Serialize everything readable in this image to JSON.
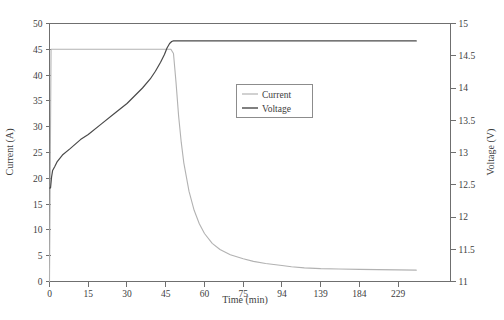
{
  "chart_data": {
    "type": "line",
    "title": "",
    "subtitle": "",
    "xlabel": "Time (min)",
    "ylabel": "Current (A)",
    "y2label": "Voltage (V)",
    "grid": false,
    "legend_position": "center-right",
    "x_axis": {
      "label": "Time (min)",
      "scale": "categorical-uneven",
      "tick_labels": [
        "0",
        "15",
        "30",
        "45",
        "60",
        "75",
        "94",
        "139",
        "184",
        "229"
      ],
      "tick_values": [
        0,
        15,
        30,
        45,
        60,
        75,
        94,
        139,
        184,
        229
      ]
    },
    "y_axis_left": {
      "label": "Current (A)",
      "ylim": [
        0,
        50
      ],
      "tick_step": 5,
      "tick_labels": [
        "0",
        "5",
        "10",
        "15",
        "20",
        "25",
        "30",
        "35",
        "40",
        "45",
        "50"
      ],
      "tick_values": [
        0,
        5,
        10,
        15,
        20,
        25,
        30,
        35,
        40,
        45,
        50
      ]
    },
    "y_axis_right": {
      "label": "Voltage (V)",
      "ylim": [
        11,
        15
      ],
      "tick_step": 0.5,
      "tick_labels": [
        "11",
        "11.5",
        "12",
        "12.5",
        "13",
        "13.5",
        "14",
        "14.5",
        "15"
      ],
      "tick_values": [
        11,
        11.5,
        12,
        12.5,
        13,
        13.5,
        14,
        14.5,
        15
      ]
    },
    "series": [
      {
        "name": "Current",
        "axis": "left",
        "unit": "A",
        "color": "#b2b2b2",
        "x": [
          0,
          0.6,
          1.5,
          3,
          6,
          10,
          15,
          20,
          25,
          30,
          35,
          40,
          45,
          47,
          48,
          49,
          50,
          51,
          52,
          54,
          56,
          58,
          60,
          63,
          66,
          70,
          75,
          80,
          86,
          94,
          105,
          120,
          139,
          160,
          184,
          205,
          229,
          250
        ],
        "values": [
          0,
          45,
          45,
          45,
          45,
          45,
          45,
          45,
          45,
          45,
          45,
          45,
          45,
          45,
          44.2,
          38.5,
          32.0,
          27.0,
          23.0,
          17.5,
          13.8,
          11.2,
          9.3,
          7.4,
          6.2,
          5.2,
          4.4,
          3.9,
          3.5,
          3.1,
          2.85,
          2.65,
          2.5,
          2.42,
          2.35,
          2.3,
          2.25,
          2.2
        ]
      },
      {
        "name": "Voltage",
        "axis": "right",
        "unit": "V",
        "color": "#4a4a4a",
        "x": [
          0,
          0.4,
          0.8,
          1.2,
          2,
          3,
          5,
          8,
          12,
          15,
          20,
          25,
          30,
          33,
          36,
          39,
          41,
          43,
          44.5,
          45.5,
          46.5,
          47.3,
          48,
          50,
          55,
          60,
          75,
          94,
          139,
          184,
          229,
          250
        ],
        "values": [
          12.45,
          12.45,
          12.62,
          12.72,
          12.78,
          12.86,
          12.96,
          13.06,
          13.2,
          13.28,
          13.44,
          13.6,
          13.76,
          13.88,
          14.0,
          14.14,
          14.26,
          14.4,
          14.52,
          14.62,
          14.69,
          14.72,
          14.73,
          14.73,
          14.73,
          14.73,
          14.73,
          14.73,
          14.73,
          14.73,
          14.73,
          14.73
        ]
      }
    ],
    "annotations": []
  },
  "legend": {
    "items": [
      {
        "label": "Current",
        "color": "#b2b2b2"
      },
      {
        "label": "Voltage",
        "color": "#4a4a4a"
      }
    ]
  }
}
